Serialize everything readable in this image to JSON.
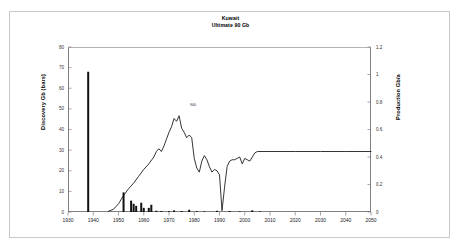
{
  "chart_data": {
    "type": "bar",
    "title": "Kuwait",
    "subtitle": "Ultimate  90 Gb",
    "xlabel": "",
    "ylabel": "Discovery Gb (bars)",
    "y2label": "Production Gb/a",
    "xlim": [
      1930,
      2050
    ],
    "ylim": [
      0,
      80
    ],
    "y2lim": [
      0,
      1.2
    ],
    "grid": false,
    "legend_position": "none",
    "x_ticks": [
      "1930",
      "1940",
      "1950",
      "1960",
      "1970",
      "1980",
      "1990",
      "2000",
      "2010",
      "2020",
      "2030",
      "2040",
      "2050"
    ],
    "y_ticks_left": [
      "0",
      "10",
      "20",
      "30",
      "40",
      "50",
      "60",
      "70",
      "80"
    ],
    "y_ticks_right": [
      "0",
      "0.2",
      "0.4",
      "0.6",
      "0.8",
      "1",
      "1.2"
    ],
    "annotation": "900",
    "series": [
      {
        "name": "Discovery Gb (bars)",
        "axis": "left",
        "type": "bar",
        "x": [
          1938,
          1952,
          1955,
          1956,
          1957,
          1959,
          1960,
          1962,
          1963,
          1965,
          1967,
          1970,
          1972,
          1975,
          1978,
          1981,
          1984,
          1989,
          1994,
          1998,
          2003,
          2006
        ],
        "values": [
          68,
          9.5,
          5.5,
          4.0,
          3.0,
          4.5,
          2.0,
          2.0,
          3.5,
          0.6,
          0.5,
          0.4,
          0.8,
          0.5,
          1.1,
          0.4,
          0.3,
          0.6,
          0.5,
          0.3,
          0.8,
          0.3
        ]
      },
      {
        "name": "Production Gb/a",
        "axis": "right",
        "type": "line",
        "x": [
          1946,
          1948,
          1950,
          1952,
          1954,
          1956,
          1958,
          1960,
          1962,
          1964,
          1965,
          1966,
          1967,
          1968,
          1969,
          1970,
          1971,
          1972,
          1973,
          1974,
          1975,
          1976,
          1977,
          1978,
          1979,
          1980,
          1981,
          1982,
          1983,
          1984,
          1985,
          1986,
          1987,
          1988,
          1989,
          1990,
          1991,
          1992,
          1993,
          1994,
          1995,
          1996,
          1997,
          1998,
          1999,
          2000,
          2001,
          2002,
          2003,
          2004,
          2005,
          2010,
          2020,
          2030,
          2040,
          2050
        ],
        "values": [
          0.005,
          0.02,
          0.06,
          0.12,
          0.17,
          0.21,
          0.26,
          0.31,
          0.35,
          0.4,
          0.44,
          0.46,
          0.44,
          0.48,
          0.53,
          0.58,
          0.62,
          0.68,
          0.66,
          0.7,
          0.61,
          0.58,
          0.54,
          0.56,
          0.54,
          0.39,
          0.32,
          0.29,
          0.37,
          0.41,
          0.38,
          0.33,
          0.29,
          0.31,
          0.3,
          0.27,
          0.01,
          0.18,
          0.33,
          0.37,
          0.38,
          0.38,
          0.39,
          0.4,
          0.35,
          0.39,
          0.38,
          0.37,
          0.4,
          0.43,
          0.44,
          0.44,
          0.44,
          0.44,
          0.44,
          0.44
        ]
      }
    ]
  },
  "axes": {
    "left_title": "Discovery Gb (bars)",
    "right_title": "Production Gb/a"
  },
  "header": {
    "title": "Kuwait",
    "subtitle": "Ultimate  90 Gb"
  }
}
